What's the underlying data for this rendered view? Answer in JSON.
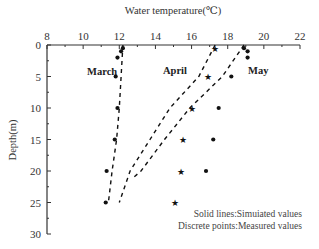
{
  "chart_data": {
    "type": "line",
    "title": "",
    "xlabel": "Water temperature(℃)",
    "ylabel": "Depth(m)",
    "xlim": [
      8,
      22
    ],
    "ylim": [
      30,
      0
    ],
    "x_axis_position": "top",
    "y_inverted": true,
    "xticks": [
      8,
      10,
      12,
      14,
      16,
      18,
      20,
      22
    ],
    "yticks": [
      0,
      5,
      10,
      15,
      20,
      25,
      30
    ],
    "grid": false,
    "series": [
      {
        "name": "March",
        "kind": "simulated",
        "style": "dashed",
        "points": [
          [
            12.2,
            0
          ],
          [
            12.1,
            5
          ],
          [
            12.0,
            10
          ],
          [
            11.85,
            15
          ],
          [
            11.6,
            20
          ],
          [
            11.4,
            25
          ]
        ]
      },
      {
        "name": "April",
        "kind": "simulated",
        "style": "dashed",
        "points": [
          [
            17.3,
            0
          ],
          [
            16.4,
            5
          ],
          [
            14.8,
            10
          ],
          [
            13.7,
            15
          ],
          [
            12.6,
            20
          ],
          [
            12.0,
            25
          ]
        ]
      },
      {
        "name": "May",
        "kind": "simulated",
        "style": "dashed",
        "points": [
          [
            18.9,
            0
          ],
          [
            17.7,
            5
          ],
          [
            15.9,
            10
          ],
          [
            14.5,
            15
          ],
          [
            13.2,
            20
          ],
          [
            12.8,
            21
          ]
        ]
      },
      {
        "name": "March",
        "kind": "measured",
        "marker": "dot",
        "points": [
          [
            12.2,
            0.5
          ],
          [
            12.1,
            1
          ],
          [
            11.9,
            2
          ],
          [
            11.8,
            5
          ],
          [
            11.9,
            10
          ],
          [
            11.75,
            15
          ],
          [
            11.3,
            20
          ],
          [
            11.25,
            25
          ]
        ]
      },
      {
        "name": "April",
        "kind": "measured",
        "marker": "star",
        "points": [
          [
            17.3,
            0.5
          ],
          [
            16.9,
            5
          ],
          [
            16.0,
            10
          ],
          [
            15.5,
            15
          ],
          [
            15.4,
            20
          ],
          [
            15.1,
            25
          ]
        ]
      },
      {
        "name": "May",
        "kind": "measured",
        "marker": "dot",
        "points": [
          [
            18.9,
            0.5
          ],
          [
            19.1,
            1
          ],
          [
            19.1,
            2
          ],
          [
            18.2,
            5
          ],
          [
            17.5,
            10
          ],
          [
            17.2,
            15
          ],
          [
            16.8,
            20
          ]
        ]
      }
    ],
    "annotations": [
      {
        "text": "March",
        "x": 10.6,
        "y": 4.6
      },
      {
        "text": "April",
        "x": 14.3,
        "y": 4.3
      },
      {
        "text": "May",
        "x": 19.6,
        "y": 4.3
      }
    ],
    "legend_notes": [
      "Solid lines:Simuiated values",
      "Discrete points:Measured values"
    ]
  },
  "labels": {
    "xlabel": "Water temperature(℃)",
    "ylabel": "Depth(m)",
    "march": "March",
    "april": "April",
    "may": "May",
    "note1": "Solid lines:Simuiated values",
    "note2": "Discrete points:Measured values"
  }
}
